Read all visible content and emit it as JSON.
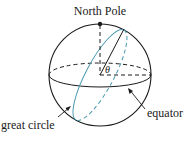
{
  "diagram": {
    "labels": {
      "north_pole": "North Pole",
      "theta": "θ",
      "great_circle": "great circle",
      "equator": "equator"
    },
    "colors": {
      "ink": "#1a1a1a",
      "great_circle": "#4a9ab0"
    }
  }
}
